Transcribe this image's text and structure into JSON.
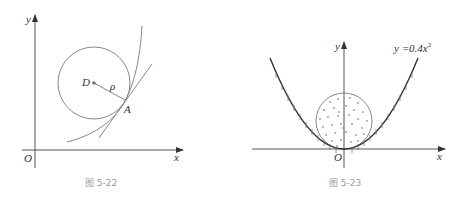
{
  "figures": [
    {
      "id": "fig-5-22",
      "caption": "图 5-22",
      "labels": {
        "y_axis": "y",
        "x_axis": "x",
        "origin": "O",
        "center": "D",
        "radius": "ρ",
        "point": "A"
      },
      "elements": [
        "curve",
        "osculating circle",
        "tangent line at A",
        "radius segment D-A"
      ]
    },
    {
      "id": "fig-5-23",
      "caption": "图 5-23",
      "labels": {
        "y_axis": "y",
        "x_axis": "x",
        "origin": "O",
        "equation": "y =0.4x",
        "equation_exp": "2"
      },
      "elements": [
        "parabola y=0.4x^2 with hatching below",
        "dotted circle inside parabola touching vertex"
      ]
    }
  ],
  "colors": {
    "axis": "#555555",
    "curve": "#888888",
    "parabola": "#333333",
    "caption": "#999999"
  }
}
